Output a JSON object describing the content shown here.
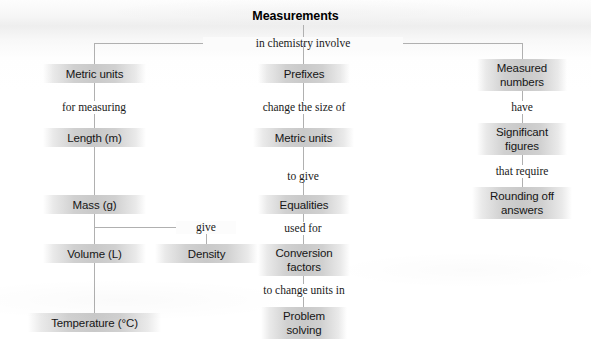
{
  "diagram": {
    "type": "concept-map",
    "title": "Measurements",
    "root_connector": "in chemistry involve",
    "branches": [
      {
        "id": "metric-units",
        "column": "left",
        "chain": [
          {
            "kind": "node",
            "text": "Metric units"
          },
          {
            "kind": "label",
            "text": "for measuring"
          },
          {
            "kind": "node",
            "text": "Length (m)"
          },
          {
            "kind": "node",
            "text": "Mass (g)"
          },
          {
            "kind": "node",
            "text": "Volume (L)"
          },
          {
            "kind": "node",
            "text": "Temperature (°C)"
          }
        ]
      },
      {
        "id": "prefixes",
        "column": "center",
        "chain": [
          {
            "kind": "node",
            "text": "Prefixes"
          },
          {
            "kind": "label",
            "text": "change the size of"
          },
          {
            "kind": "node",
            "text": "Metric units"
          },
          {
            "kind": "label",
            "text": "to give"
          },
          {
            "kind": "node",
            "text": "Equalities"
          },
          {
            "kind": "label",
            "text": "used for"
          },
          {
            "kind": "node",
            "text": "Conversion factors",
            "line1": "Conversion",
            "line2": "factors"
          },
          {
            "kind": "label",
            "text": "to change units in"
          },
          {
            "kind": "node",
            "text": "Problem solving",
            "line1": "Problem",
            "line2": "solving"
          }
        ]
      },
      {
        "id": "measured-numbers",
        "column": "right",
        "chain": [
          {
            "kind": "node",
            "text": "Measured numbers",
            "line1": "Measured",
            "line2": "numbers"
          },
          {
            "kind": "label",
            "text": "have"
          },
          {
            "kind": "node",
            "text": "Significant figures",
            "line1": "Significant",
            "line2": "figures"
          },
          {
            "kind": "label",
            "text": "that require"
          },
          {
            "kind": "node",
            "text": "Rounding off answers",
            "line1": "Rounding off",
            "line2": "answers"
          }
        ]
      },
      {
        "id": "density",
        "column": "left-offshoot",
        "chain": [
          {
            "kind": "label",
            "text": "give"
          },
          {
            "kind": "node",
            "text": "Density"
          }
        ]
      }
    ],
    "colors": {
      "node_fill": "#c9c9c9",
      "line": "#b0b0b0",
      "text": "#161616",
      "page_background": "#ffffff"
    }
  }
}
